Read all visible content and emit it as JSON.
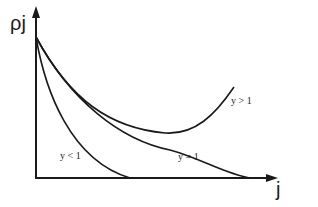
{
  "diagram": {
    "y_axis_label": "ρj",
    "x_axis_label": "j",
    "curves": [
      {
        "id": "y-less-1",
        "label": "y < 1"
      },
      {
        "id": "y-equal-1",
        "label": "y = 1"
      },
      {
        "id": "y-greater-1",
        "label": "y > 1"
      }
    ],
    "colors": {
      "line": "#1a1a1a",
      "background": "#ffffff"
    }
  }
}
